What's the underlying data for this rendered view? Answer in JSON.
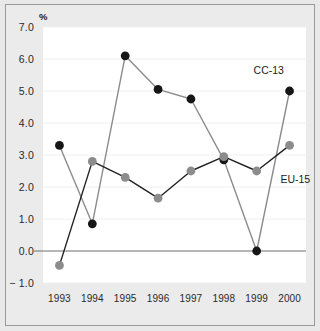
{
  "chart_data": {
    "type": "line",
    "title": "",
    "subtitle": "",
    "xlabel": "",
    "ylabel": "%",
    "unit_label": "%",
    "categories": [
      "1993",
      "1994",
      "1995",
      "1996",
      "1997",
      "1998",
      "1999",
      "2000"
    ],
    "x": [
      1993,
      1994,
      1995,
      1996,
      1997,
      1998,
      1999,
      2000
    ],
    "series": [
      {
        "name": "CC-13",
        "color": "#161616",
        "marker": "circle",
        "line_color": "#8c8c8c",
        "values": [
          3.3,
          0.85,
          6.1,
          5.05,
          4.75,
          2.85,
          0.0,
          5.0
        ]
      },
      {
        "name": "EU-15",
        "color": "#8c8c8c",
        "marker": "circle",
        "line_color": "#222222",
        "values": [
          -0.45,
          2.8,
          2.3,
          1.65,
          2.5,
          2.95,
          2.5,
          3.3
        ]
      }
    ],
    "ylim": [
      -1.0,
      7.0
    ],
    "yticks": [
      -1.0,
      0.0,
      1.0,
      2.0,
      3.0,
      4.0,
      5.0,
      6.0,
      7.0
    ],
    "ytick_labels": [
      "− 1.0",
      "0.0",
      "1.0",
      "2.0",
      "3.0",
      "4.0",
      "5.0",
      "6.0",
      "7.0"
    ],
    "grid": true,
    "grid_color": "#f0f0f0",
    "zero_line": true,
    "zero_line_color": "#6e6e6e",
    "legend": "inline-annotations",
    "annotations": [
      {
        "text": "CC-13",
        "x": 2000,
        "y": 5.65,
        "align": "right"
      },
      {
        "text": "EU-15",
        "x": 1999.6,
        "y": 2.25,
        "align": "left"
      }
    ],
    "plot_background": "#ffffff",
    "figure_background": "#ebebeb",
    "border_color": "#9a9a9a"
  }
}
